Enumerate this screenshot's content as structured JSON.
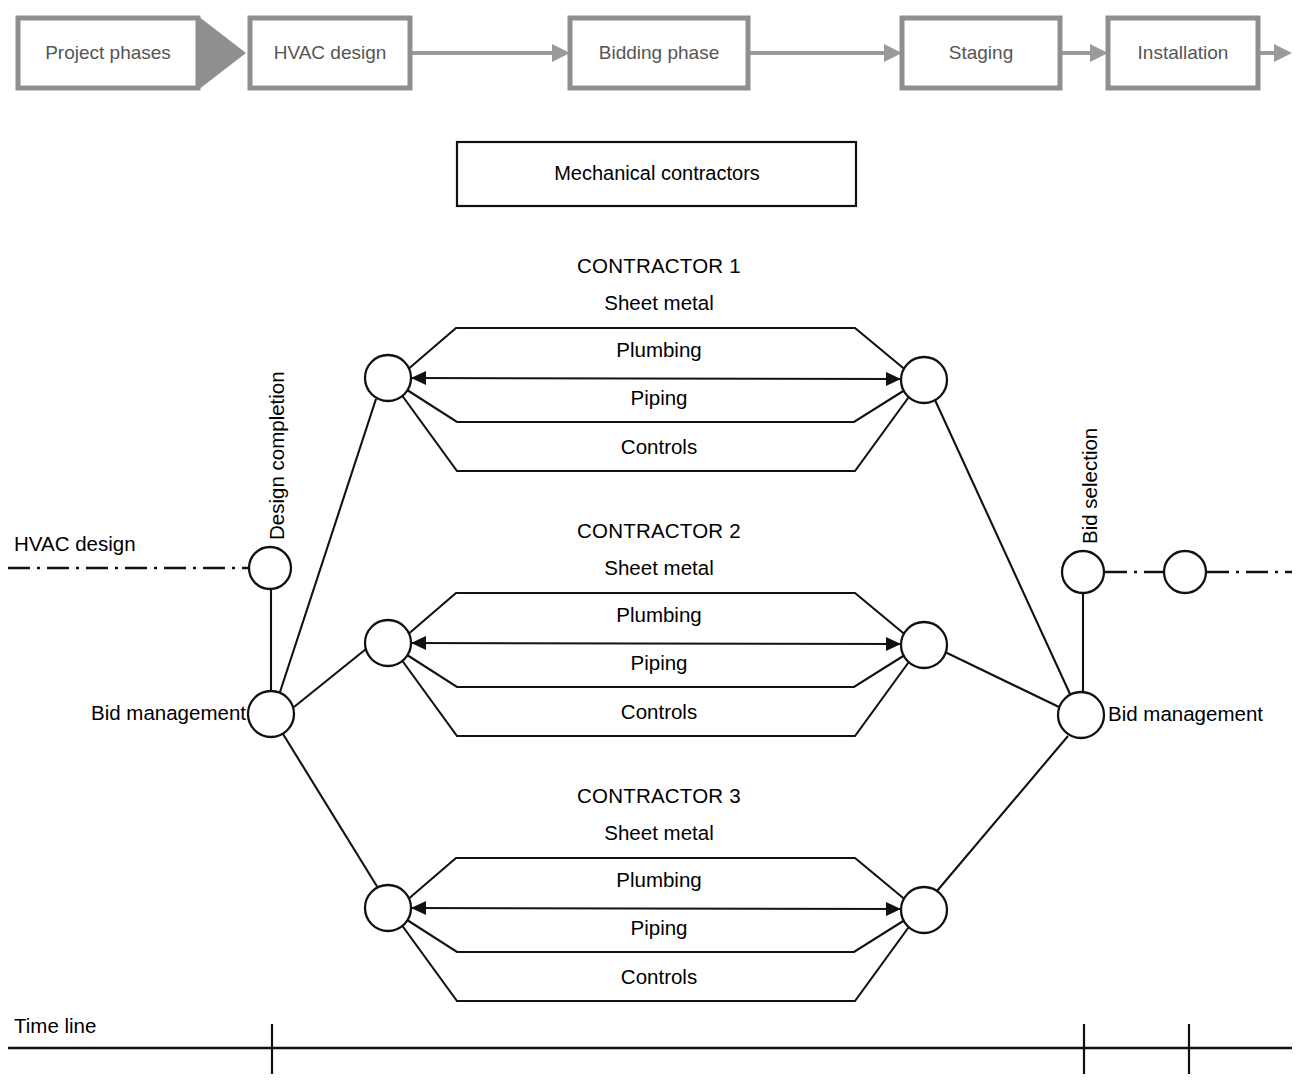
{
  "figure": {
    "type": "network-diagram",
    "background": "#ffffff",
    "line_color": "#111111",
    "phase_box_color": "#8f8f8f"
  },
  "phases": {
    "items": [
      {
        "label": "Project phases",
        "shape": "chevron"
      },
      {
        "label": "HVAC design",
        "shape": "rect"
      },
      {
        "label": "Bidding phase",
        "shape": "rect"
      },
      {
        "label": "Staging",
        "shape": "rect"
      },
      {
        "label": "Installation",
        "shape": "rect"
      }
    ]
  },
  "mechanical_contractors": {
    "label": "Mechanical contractors"
  },
  "contractors": [
    {
      "title": "CONTRACTOR 1",
      "tasks": [
        "Sheet metal",
        "Plumbing",
        "Piping",
        "Controls"
      ]
    },
    {
      "title": "CONTRACTOR 2",
      "tasks": [
        "Sheet metal",
        "Plumbing",
        "Piping",
        "Controls"
      ]
    },
    {
      "title": "CONTRACTOR 3",
      "tasks": [
        "Sheet metal",
        "Plumbing",
        "Piping",
        "Controls"
      ]
    }
  ],
  "milestones": {
    "hvac_design": "HVAC design",
    "design_completion": "Design completion",
    "bid_management_left": "Bid management",
    "bid_selection": "Bid selection",
    "bid_management_right": "Bid management"
  },
  "timeline": {
    "label": "Time line",
    "ticks": 3
  }
}
